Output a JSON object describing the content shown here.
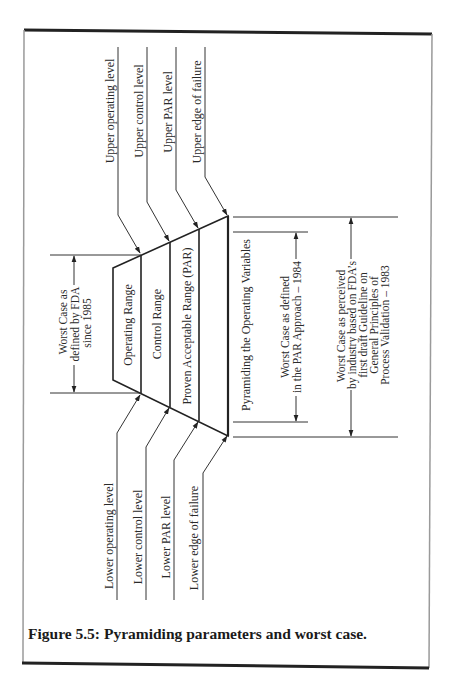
{
  "figure": {
    "caption": "Figure 5.5: Pyramiding parameters and worst case.",
    "upper_levels": [
      "Upper operating level",
      "Upper control level",
      "Upper PAR level",
      "Upper edge of failure"
    ],
    "lower_levels": [
      "Lower operating level",
      "Lower control level",
      "Lower PAR level",
      "Lower edge of failure"
    ],
    "ranges": [
      "Operating Range",
      "Control Range",
      "Proven Acceptable Range (PAR)"
    ],
    "pyramid_label": "Pyramiding the Operating Variables",
    "worst_case_fda": [
      "Worst Case as",
      "defined by FDA",
      "since 1985"
    ],
    "worst_case_par": [
      "Worst Case as defined",
      "in the PAR Approach – 1984"
    ],
    "worst_case_industry": [
      "Worst Case as perceived",
      "by industry based on FDA’s",
      "first draft Guideline on",
      "General Principles of",
      "Process Validation – 1983"
    ]
  },
  "colors": {
    "background": "#ffffff",
    "ink": "#222222",
    "frame_side": "#9a9a9a"
  }
}
